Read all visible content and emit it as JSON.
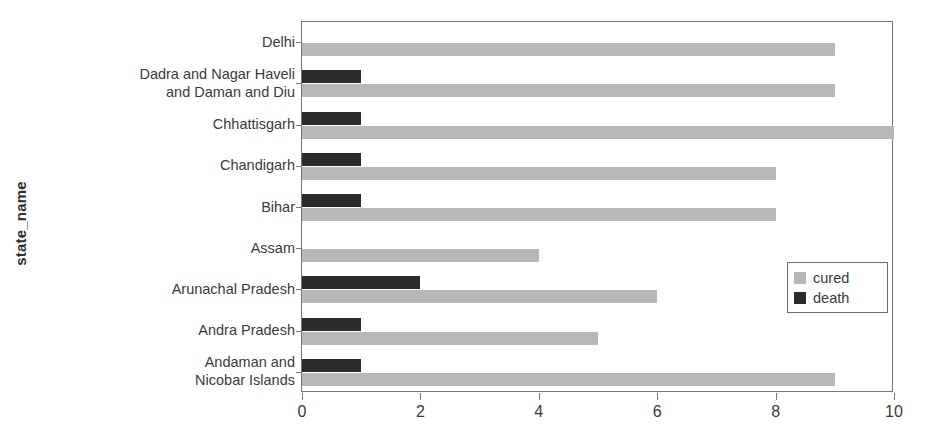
{
  "chart_data": {
    "type": "bar",
    "orientation": "horizontal",
    "title": "",
    "xlabel": "",
    "ylabel": "state_name",
    "xlim": [
      0,
      10
    ],
    "xticks": [
      0,
      2,
      4,
      6,
      8,
      10
    ],
    "xtick_labels": [
      "0",
      "2",
      "4",
      "6",
      "8",
      "10"
    ],
    "grid": false,
    "legend_position": "center right",
    "categories": [
      "Delhi",
      "Dadra and Nagar Haveli\nand Daman and Diu",
      "Chhattisgarh",
      "Chandigarh",
      "Bihar",
      "Assam",
      "Arunachal Pradesh",
      "Andra Pradesh",
      "Andaman and\nNicobar Islands"
    ],
    "series": [
      {
        "name": "cured",
        "color": "#b8b8b8",
        "values": [
          9,
          9,
          10,
          8,
          8,
          4,
          6,
          5,
          9
        ]
      },
      {
        "name": "death",
        "color": "#2b2b2b",
        "values": [
          0,
          1,
          1,
          1,
          1,
          0,
          2,
          1,
          1
        ]
      }
    ]
  },
  "legend": {
    "entries": [
      {
        "label": "cured",
        "color": "#b8b8b8"
      },
      {
        "label": "death",
        "color": "#2b2b2b"
      }
    ]
  },
  "axes": {
    "y_title": "state_name",
    "frame_color": "#777777"
  }
}
